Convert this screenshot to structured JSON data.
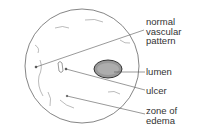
{
  "diagram": {
    "labels": [
      {
        "id": "normal-vascular-pattern",
        "text": "normal\nvascular\npattern"
      },
      {
        "id": "lumen",
        "text": "lumen"
      },
      {
        "id": "ulcer",
        "text": "ulcer"
      },
      {
        "id": "zone-of-edema",
        "text": "zone of\nedema"
      }
    ],
    "colors": {
      "line": "#555555",
      "text": "#333333",
      "lumen": "#444444"
    }
  }
}
